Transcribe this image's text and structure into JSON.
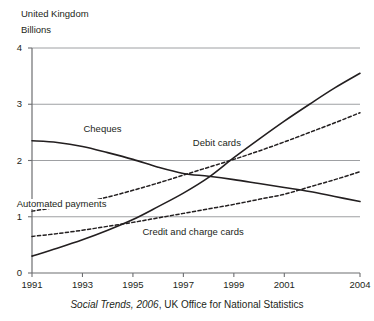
{
  "header": {
    "country": "United Kingdom",
    "units": "Billions"
  },
  "source": {
    "emphasis": "Social Trends, 2006",
    "rest": ", UK Office for National Statistics"
  },
  "axes": {
    "y_ticks": [
      "0",
      "1",
      "2",
      "3",
      "4"
    ],
    "x_ticks": [
      "1991",
      "1993",
      "1995",
      "1997",
      "1999",
      "2001",
      "2004"
    ]
  },
  "labels": {
    "cheques": "Cheques",
    "debit": "Debit cards",
    "automated": "Automated payments",
    "credit": "Credit and charge cards"
  },
  "chart_data": {
    "type": "line",
    "title": "United Kingdom",
    "subtitle": "Billions",
    "xlabel": "",
    "ylabel": "Billions",
    "ylim": [
      0,
      4
    ],
    "xlim": [
      1991,
      2004
    ],
    "ytick_values": [
      0,
      1,
      2,
      3,
      4
    ],
    "xtick_values": [
      1991,
      1993,
      1995,
      1997,
      1999,
      2001,
      2004
    ],
    "grid": "horizontal",
    "legend": "inline-annotations",
    "source": "Social Trends, 2006, UK Office for National Statistics",
    "x": [
      1991,
      1992,
      1993,
      1994,
      1995,
      1996,
      1997,
      1998,
      1999,
      2000,
      2001,
      2002,
      2003,
      2004
    ],
    "series": [
      {
        "name": "Cheques",
        "style": "solid",
        "color": "#231f20",
        "values": [
          2.35,
          2.32,
          2.25,
          2.14,
          2.02,
          1.88,
          1.77,
          1.72,
          1.66,
          1.59,
          1.52,
          1.45,
          1.36,
          1.27
        ]
      },
      {
        "name": "Automated payments",
        "style": "dashed",
        "color": "#231f20",
        "values": [
          1.1,
          1.17,
          1.25,
          1.35,
          1.47,
          1.6,
          1.74,
          1.88,
          2.02,
          2.17,
          2.33,
          2.5,
          2.67,
          2.85
        ]
      },
      {
        "name": "Credit and charge cards",
        "style": "dashed",
        "color": "#231f20",
        "values": [
          0.65,
          0.7,
          0.76,
          0.83,
          0.9,
          0.98,
          1.06,
          1.14,
          1.22,
          1.31,
          1.4,
          1.53,
          1.66,
          1.8
        ]
      },
      {
        "name": "Debit cards",
        "style": "solid",
        "color": "#231f20",
        "values": [
          0.3,
          0.44,
          0.59,
          0.76,
          0.95,
          1.18,
          1.42,
          1.7,
          2.05,
          2.38,
          2.7,
          3.0,
          3.29,
          3.55
        ]
      }
    ]
  }
}
